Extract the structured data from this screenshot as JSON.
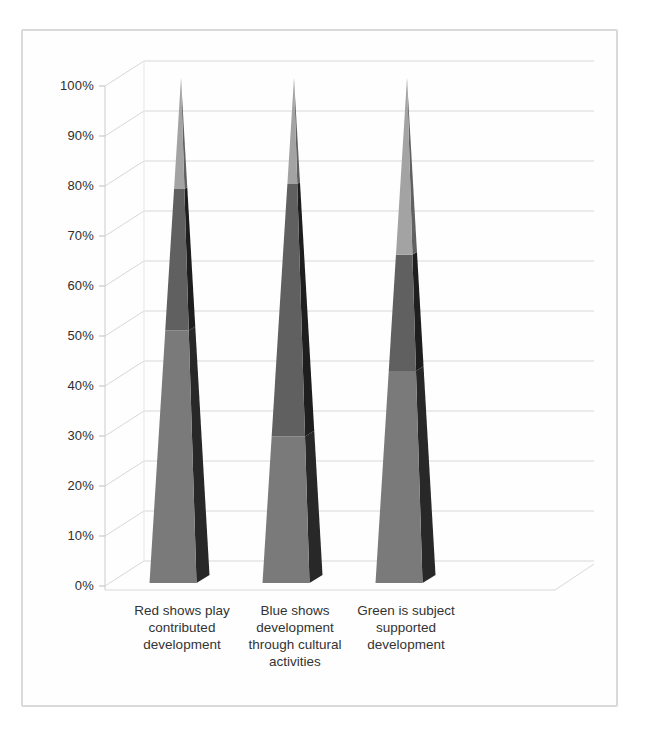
{
  "chart_data": {
    "type": "bar",
    "subtype": "3d-cone-100-percent-stacked",
    "title": "",
    "xlabel": "",
    "ylabel": "",
    "categories": [
      "Red shows play contributed development",
      "Blue shows development through cultural activities",
      "Green is subject supported development"
    ],
    "category_label_lines": [
      [
        "Red shows play",
        "contributed",
        "development"
      ],
      [
        "Blue shows",
        "development",
        "through cultural",
        "activities"
      ],
      [
        "Green is subject",
        "supported",
        "development"
      ]
    ],
    "series": [
      {
        "name": "bottom segment",
        "values": [
          50,
          29,
          42
        ]
      },
      {
        "name": "middle segment",
        "values": [
          28,
          50,
          23
        ]
      },
      {
        "name": "top segment",
        "values": [
          22,
          21,
          35
        ]
      }
    ],
    "segment_boundaries_pct": [
      [
        50,
        78
      ],
      [
        29,
        79
      ],
      [
        42,
        65
      ]
    ],
    "ylim": [
      0,
      100
    ],
    "yticks": [
      "100%",
      "90%",
      "80%",
      "70%",
      "60%",
      "50%",
      "40%",
      "30%",
      "20%",
      "10%",
      "0%"
    ],
    "grid": true,
    "legend": false
  },
  "style": {
    "segment_front_colors": [
      "#7a7a7a",
      "#606060",
      "#a3a3a3"
    ],
    "segment_side_colors": [
      "#282828",
      "#1e1e1e",
      "#616161"
    ],
    "gridline_color": "#d8d8d8",
    "axis_line_color": "#cccccc",
    "frame_border_color": "#d9d9d9",
    "axis_text_color": "#2e2e2e"
  }
}
